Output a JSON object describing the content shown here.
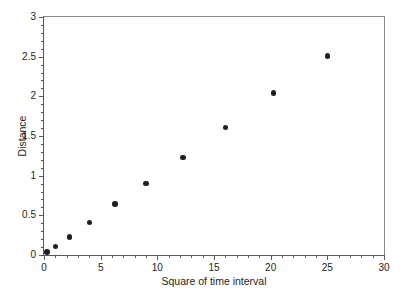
{
  "chart_data": {
    "type": "scatter",
    "title": "",
    "xlabel": "Square of time interval",
    "ylabel": "Distance",
    "xlim": [
      0,
      30
    ],
    "ylim": [
      0,
      3
    ],
    "grid": false,
    "legend": null,
    "x_ticks": [
      0,
      5,
      10,
      15,
      20,
      25,
      30
    ],
    "x_tick_labels": [
      "0",
      "5",
      "10",
      "15",
      "20",
      "25",
      "30"
    ],
    "x_minor_tick_step": 1,
    "y_ticks": [
      0,
      0.5,
      1,
      1.5,
      2,
      2.5,
      3
    ],
    "y_tick_labels": [
      "0",
      "0.5",
      "1",
      "1.5",
      "2",
      "2.5",
      "3"
    ],
    "y_minor_tick_step": 0.1,
    "marker": "filled-circle",
    "marker_color": "#231f20",
    "axis_color": "#58595b",
    "background_color": "#ffffff",
    "points": [
      {
        "x": 0.25,
        "y": 0.04
      },
      {
        "x": 1.0,
        "y": 0.11
      },
      {
        "x": 2.25,
        "y": 0.23
      },
      {
        "x": 4.0,
        "y": 0.41
      },
      {
        "x": 6.25,
        "y": 0.64
      },
      {
        "x": 9.0,
        "y": 0.9
      },
      {
        "x": 12.25,
        "y": 1.23
      },
      {
        "x": 16.0,
        "y": 1.61
      },
      {
        "x": 20.25,
        "y": 2.04
      },
      {
        "x": 25.0,
        "y": 2.51
      }
    ]
  }
}
